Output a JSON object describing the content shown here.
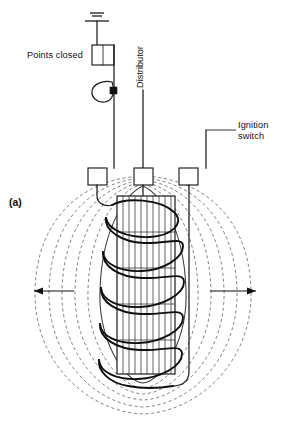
{
  "figure": {
    "id_label": "(a)"
  },
  "labels": {
    "points_closed": "Points closed",
    "distributor": "Distributor",
    "ignition_switch_line1": "Ignition",
    "ignition_switch_line2": "switch"
  },
  "components": {
    "ground_symbol": "earth-ground",
    "points_box": "contact-breaker-points",
    "condenser": "condenser-capacitor",
    "terminals": [
      {
        "name": "left-terminal",
        "connects": "points-and-condenser"
      },
      {
        "name": "center-terminal",
        "connects": "distributor"
      },
      {
        "name": "right-terminal",
        "connects": "ignition-switch"
      }
    ],
    "core": "laminated-iron-core",
    "primary_winding": "helical-primary-coil",
    "secondary_winding": "hatched-secondary-windings"
  },
  "field": {
    "description": "magnetic flux lines surrounding energised coil",
    "line_count": 6,
    "direction_markers": [
      {
        "name": "left-flux-arrow",
        "direction": "left"
      },
      {
        "name": "right-flux-arrow",
        "direction": "right"
      }
    ]
  },
  "colors": {
    "ink": "#1a1a1a",
    "field_line": "#6f6f6f",
    "background": "#ffffff"
  }
}
